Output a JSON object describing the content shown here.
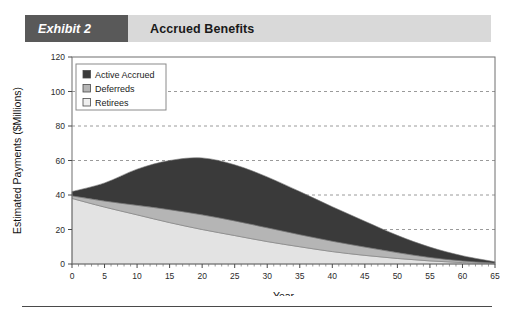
{
  "header": {
    "tag": "Exhibit 2",
    "title": "Accrued Benefits",
    "tag_bg": "#595959",
    "bar_bg": "#d9d9d9"
  },
  "chart_data": {
    "type": "area",
    "stacked": true,
    "title": "Accrued Benefits",
    "xlabel": "Year",
    "ylabel": "Estimated Payments ($Millions)",
    "xlim": [
      0,
      65
    ],
    "ylim": [
      0,
      120
    ],
    "xticks": [
      0,
      5,
      10,
      15,
      20,
      25,
      30,
      35,
      40,
      45,
      50,
      55,
      60,
      65
    ],
    "yticks": [
      0,
      20,
      40,
      60,
      80,
      100,
      120
    ],
    "xtick_labels": [
      "0",
      "5",
      "10",
      "15",
      "20",
      "25",
      "30",
      "35",
      "40",
      "45",
      "50",
      "55",
      "60",
      "65"
    ],
    "ytick_labels": [
      "0",
      "20",
      "40",
      "60",
      "80",
      "100",
      "120"
    ],
    "grid": "horizontal-dashed",
    "legend_position": "top-left-inside",
    "x": [
      0,
      5,
      10,
      15,
      20,
      25,
      30,
      35,
      40,
      45,
      50,
      55,
      60,
      65
    ],
    "series": [
      {
        "name": "Retirees",
        "color": "#e3e3e3",
        "values": [
          38.0,
          33.0,
          28.5,
          24.0,
          20.0,
          16.5,
          13.0,
          10.0,
          7.2,
          5.0,
          3.2,
          1.8,
          0.8,
          0.2
        ]
      },
      {
        "name": "Deferreds",
        "color": "#b5b5b5",
        "values": [
          1.5,
          3.5,
          5.5,
          7.5,
          8.5,
          8.5,
          8.0,
          7.0,
          6.0,
          4.8,
          3.4,
          2.0,
          1.0,
          0.3
        ]
      },
      {
        "name": "Active Accrued",
        "color": "#3a3a3a",
        "values": [
          2.5,
          10.5,
          21.0,
          28.5,
          33.0,
          32.5,
          29.5,
          25.0,
          20.0,
          15.0,
          10.0,
          6.0,
          3.0,
          0.8
        ]
      }
    ],
    "totals": [
      42.0,
      47.0,
      55.0,
      60.0,
      61.5,
      57.5,
      50.5,
      42.0,
      33.2,
      24.8,
      16.6,
      9.8,
      4.8,
      1.3
    ],
    "legend": [
      {
        "label": "Active Accrued",
        "color": "#3a3a3a"
      },
      {
        "label": "Deferreds",
        "color": "#b5b5b5"
      },
      {
        "label": "Retirees",
        "color": "#efefef"
      }
    ]
  }
}
